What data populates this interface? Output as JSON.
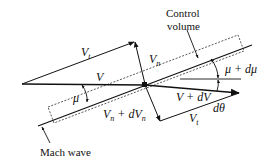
{
  "diagram": {
    "type": "velocity-diagram",
    "labels": {
      "vt_top": "V",
      "vt_top_sub": "t",
      "vn": "V",
      "vn_sub": "n",
      "v": "V",
      "mu": "μ",
      "mu_dmu": "μ + dμ",
      "v_dv": "V + dV",
      "d_theta": "dθ",
      "vn_dvn_a": "V",
      "vn_dvn_sub": "n",
      "vn_dvn_b": " + dV",
      "vn_dvn_sub2": "n",
      "vt_bottom": "V",
      "vt_bottom_sub": "t",
      "control_volume_line1": "Control",
      "control_volume_line2": "volume",
      "mach_wave": "Mach wave"
    },
    "colors": {
      "line": "#111111",
      "background": "#ffffff"
    }
  }
}
